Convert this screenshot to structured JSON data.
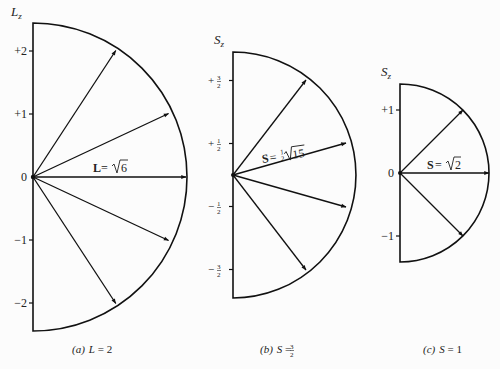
{
  "figure": {
    "panels": [
      {
        "id": "a",
        "axis_label": "L",
        "axis_sub": "z",
        "caption_prefix": "(a)",
        "caption_var": "L",
        "caption_eq": " = 2",
        "vector_label_sym": "L",
        "vector_label_eq": " = ",
        "vector_label_coef": "",
        "vector_label_rad": "6",
        "ticks": [
          "+2",
          "+1",
          "0",
          "−1",
          "−2"
        ],
        "quantum_number": 2,
        "magnitude": "√6",
        "m_values": [
          2,
          1,
          0,
          -1,
          -2
        ]
      },
      {
        "id": "b",
        "axis_label": "S",
        "axis_sub": "z",
        "caption_prefix": "(b)",
        "caption_var": "S",
        "caption_eq": " = ",
        "caption_frac_num": "3",
        "caption_frac_den": "2",
        "vector_label_sym": "S",
        "vector_label_eq": " = ",
        "vector_label_coef_num": "1",
        "vector_label_coef_den": "2",
        "vector_label_rad": "15",
        "ticks": [
          {
            "sign": "+",
            "num": "3",
            "den": "2"
          },
          {
            "sign": "+",
            "num": "1",
            "den": "2"
          },
          {
            "sign": "−",
            "num": "1",
            "den": "2"
          },
          {
            "sign": "−",
            "num": "3",
            "den": "2"
          }
        ],
        "quantum_number": "3/2",
        "magnitude": "½√15",
        "m_values": [
          "3/2",
          "1/2",
          "-1/2",
          "-3/2"
        ]
      },
      {
        "id": "c",
        "axis_label": "S",
        "axis_sub": "z",
        "caption_prefix": "(c)",
        "caption_var": "S",
        "caption_eq": " = 1",
        "vector_label_sym": "S",
        "vector_label_eq": " = ",
        "vector_label_rad": "2",
        "ticks": [
          "+1",
          "0",
          "−1"
        ],
        "quantum_number": 1,
        "magnitude": "√2",
        "m_values": [
          1,
          0,
          -1
        ]
      }
    ]
  }
}
